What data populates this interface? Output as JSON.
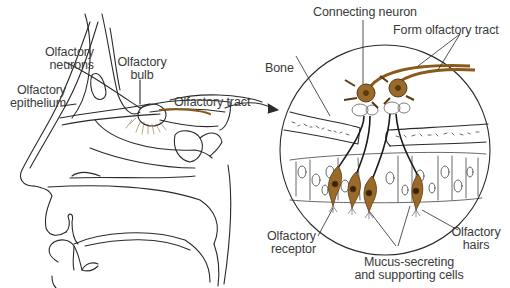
{
  "diagram": {
    "left_panel": {
      "subject": "sagittal section of nose and nasal cavity",
      "labels": {
        "olfactory_neurons": [
          "Olfactory",
          "neurons"
        ],
        "olfactory_bulb": [
          "Olfactory",
          "bulb"
        ],
        "olfactory_epithelium": [
          "Olfactory",
          "epithelium"
        ],
        "olfactory_tract": "Olfactory tract"
      }
    },
    "right_panel": {
      "subject": "magnified circular inset of olfactory epithelium",
      "labels": {
        "connecting_neuron": "Connecting neuron",
        "form_olfactory_tract": "Form olfactory tract",
        "bone": "Bone",
        "olfactory_receptor": [
          "Olfactory",
          "receptor"
        ],
        "mucus_secreting": [
          "Mucus-secreting",
          "and supporting cells"
        ],
        "olfactory_hairs": [
          "Olfactory",
          "hairs"
        ]
      }
    },
    "colors": {
      "line": "#2a2a2a",
      "neuron_fill": "#9a6a2a",
      "neuron_dark": "#5a3a12",
      "text": "#3a3a3a",
      "background": "#ffffff"
    }
  }
}
